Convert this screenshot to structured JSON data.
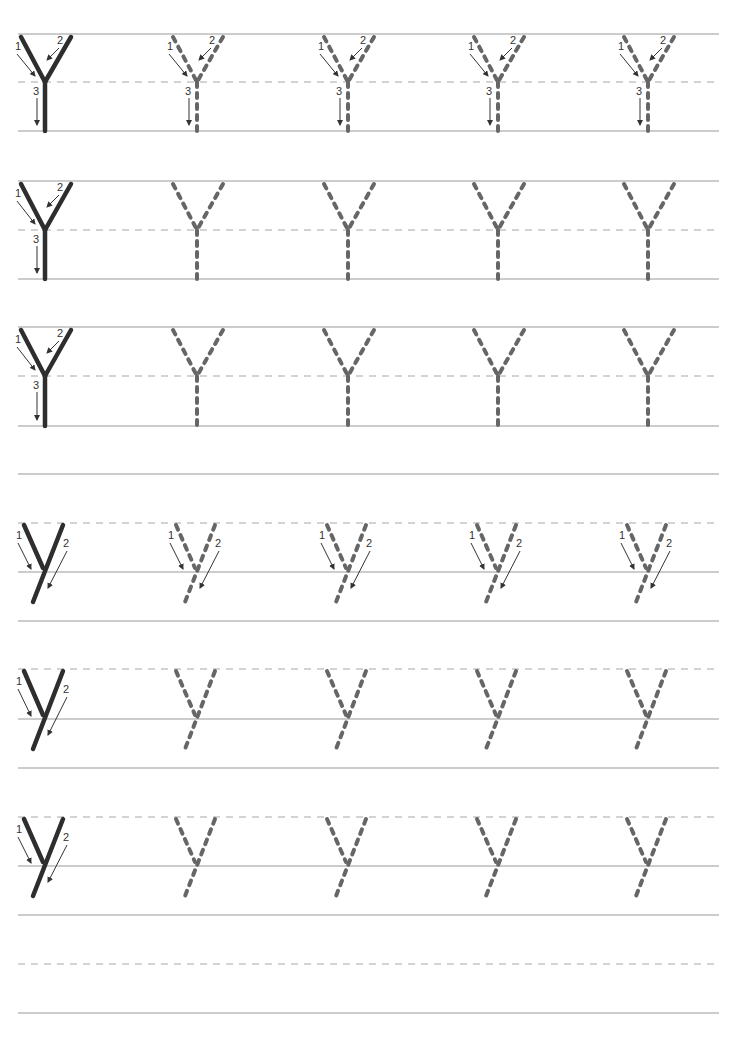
{
  "worksheet": {
    "letter_upper": "Y",
    "letter_lower": "y",
    "colors": {
      "solid_line": "#9a9a9a",
      "dashed_line": "#a8a8a8",
      "model_stroke": "#2e2e2e",
      "trace_stroke": "#666666",
      "arrow": "#333333"
    },
    "line_x_start": 18,
    "line_x_end": 719,
    "letter_columns_x": [
      45,
      197,
      348,
      498,
      648
    ],
    "uppercase_rows": [
      {
        "top": 34,
        "mid": 82,
        "base": 131,
        "trace_arrows": true
      },
      {
        "top": 181,
        "mid": 230,
        "base": 279,
        "trace_arrows": false
      },
      {
        "top": 327,
        "mid": 376,
        "base": 426,
        "trace_arrows": false
      }
    ],
    "extra_solid_lines": [
      474
    ],
    "lowercase_rows": [
      {
        "top": 523,
        "mid": 572,
        "base": 621,
        "trace_arrows": true
      },
      {
        "top": 669,
        "mid": 719,
        "base": 768,
        "trace_arrows": false
      },
      {
        "top": 817,
        "mid": 866,
        "base": 915,
        "trace_arrows": false
      }
    ],
    "blank_row": {
      "mid": 964,
      "base": 1013
    },
    "stroke_labels": {
      "one": "1",
      "two": "2",
      "three": "3"
    }
  }
}
